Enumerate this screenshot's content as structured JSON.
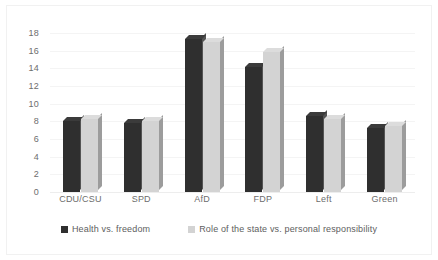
{
  "chart_data": {
    "type": "bar",
    "title": "",
    "subtitle": "",
    "xlabel": "",
    "ylabel": "",
    "categories": [
      "CDU/CSU",
      "SPD",
      "AfD",
      "FDP",
      "Left",
      "Green"
    ],
    "series": [
      {
        "name": "Health vs. freedom",
        "color": "#2f2f2f",
        "values": [
          8.0,
          7.8,
          17.3,
          14.2,
          8.6,
          7.2
        ]
      },
      {
        "name": "Role of the state vs. personal responsibility",
        "color": "#d3d3d3",
        "values": [
          8.3,
          8.0,
          17.0,
          15.8,
          8.3,
          7.5
        ]
      }
    ],
    "ylim": [
      0,
      18
    ],
    "yticks": [
      0,
      2,
      4,
      6,
      8,
      10,
      12,
      14,
      16,
      18
    ],
    "ytick_labels": [
      "0",
      "2",
      "4",
      "6",
      "8",
      "10",
      "12",
      "14",
      "16",
      "18"
    ],
    "grid": true,
    "grid_axis": "y",
    "legend_position": "bottom",
    "style": "3d-column"
  },
  "legend": {
    "items": [
      {
        "label": "Health vs. freedom",
        "swatch": "dark"
      },
      {
        "label": "Role of the state vs. personal responsibility",
        "swatch": "light"
      }
    ]
  },
  "colors": {
    "series_dark": "#2f2f2f",
    "series_light": "#d3d3d3",
    "gridline": "#f4f4f4",
    "axis_text": "#6d6d6d",
    "legend_text": "#5e5e5e",
    "background": "#ffffff",
    "frame": "#f1f1f1"
  }
}
